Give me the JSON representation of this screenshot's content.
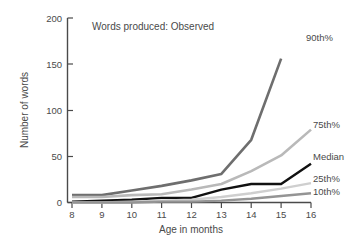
{
  "chart_data": {
    "type": "line",
    "title": "Words produced: Observed",
    "xlabel": "Age in months",
    "ylabel": "Number of words",
    "x": [
      8,
      9,
      10,
      11,
      12,
      13,
      14,
      15,
      16
    ],
    "xlim": [
      8,
      16
    ],
    "ylim": [
      0,
      200
    ],
    "xticks": [
      "8",
      "9",
      "10",
      "11",
      "12",
      "13",
      "14",
      "15",
      "16"
    ],
    "yticks": [
      "0",
      "50",
      "100",
      "150",
      "200"
    ],
    "grid": false,
    "legend_position": "right-inline-labels",
    "series": [
      {
        "name": "90th%",
        "label": "90th%",
        "color": "#6e6e6e",
        "width": 2.6,
        "values": [
          8,
          8,
          13,
          18,
          24,
          31,
          68,
          156,
          null
        ]
      },
      {
        "name": "75th%",
        "label": "75th%",
        "color": "#b9b9b9",
        "width": 2.6,
        "values": [
          6,
          6,
          8,
          9,
          14,
          20,
          34,
          51,
          79
        ]
      },
      {
        "name": "Median",
        "label": "Median",
        "color": "#111111",
        "width": 2.4,
        "values": [
          1,
          2,
          3,
          5,
          5,
          14,
          20,
          20,
          42
        ]
      },
      {
        "name": "25th%",
        "label": "25th%",
        "color": "#cfcfcf",
        "width": 2.4,
        "values": [
          0,
          0,
          1,
          2,
          3,
          6,
          10,
          15,
          21
        ]
      },
      {
        "name": "10th%",
        "label": "10th%",
        "color": "#949494",
        "width": 2.4,
        "values": [
          0,
          0,
          0,
          1,
          1,
          2,
          4,
          7,
          10
        ]
      }
    ]
  },
  "labels": {
    "series_90": "90th%",
    "series_75": "75th%",
    "series_median": "Median",
    "series_25": "25th%",
    "series_10": "10th%",
    "title": "Words produced: Observed",
    "xlabel": "Age in months",
    "ylabel": "Number of words",
    "y0": "0",
    "y50": "50",
    "y100": "100",
    "y150": "150",
    "y200": "200",
    "x8": "8",
    "x9": "9",
    "x10": "10",
    "x11": "11",
    "x12": "12",
    "x13": "13",
    "x14": "14",
    "x15": "15",
    "x16": "16"
  }
}
